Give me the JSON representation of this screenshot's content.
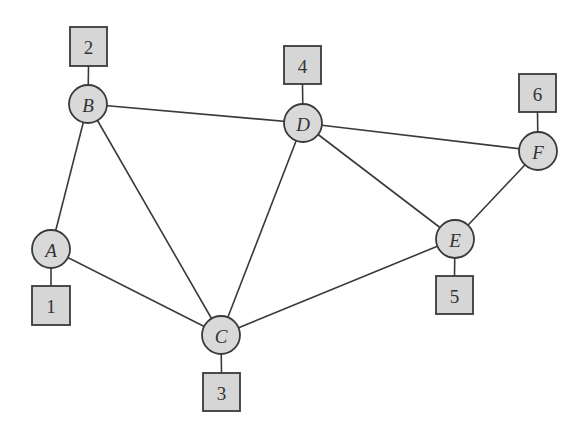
{
  "diagram": {
    "type": "graph",
    "colors": {
      "node_fill": "#d9d9d9",
      "box_fill": "#d6d6d6",
      "stroke": "#3a3a3a",
      "text": "#333333",
      "background": "#ffffff"
    },
    "nodes": [
      {
        "id": "A",
        "label": "A",
        "cx": 51,
        "cy": 249,
        "r": 19
      },
      {
        "id": "B",
        "label": "B",
        "cx": 88,
        "cy": 104,
        "r": 19
      },
      {
        "id": "C",
        "label": "C",
        "cx": 221,
        "cy": 335,
        "r": 19
      },
      {
        "id": "D",
        "label": "D",
        "cx": 303,
        "cy": 123,
        "r": 19
      },
      {
        "id": "E",
        "label": "E",
        "cx": 455,
        "cy": 239,
        "r": 19
      },
      {
        "id": "F",
        "label": "F",
        "cx": 538,
        "cy": 151,
        "r": 19
      }
    ],
    "boxes": [
      {
        "id": "1",
        "label": "1",
        "attached_to": "A",
        "x": 32,
        "y": 286,
        "w": 38,
        "h": 39
      },
      {
        "id": "2",
        "label": "2",
        "attached_to": "B",
        "x": 70,
        "y": 27,
        "w": 37,
        "h": 39
      },
      {
        "id": "3",
        "label": "3",
        "attached_to": "C",
        "x": 203,
        "y": 373,
        "w": 37,
        "h": 38
      },
      {
        "id": "4",
        "label": "4",
        "attached_to": "D",
        "x": 284,
        "y": 46,
        "w": 37,
        "h": 38
      },
      {
        "id": "5",
        "label": "5",
        "attached_to": "E",
        "x": 436,
        "y": 276,
        "w": 37,
        "h": 38
      },
      {
        "id": "6",
        "label": "6",
        "attached_to": "F",
        "x": 519,
        "y": 74,
        "w": 37,
        "h": 38
      }
    ],
    "edges": [
      [
        "A",
        "B"
      ],
      [
        "A",
        "C"
      ],
      [
        "B",
        "C"
      ],
      [
        "B",
        "D"
      ],
      [
        "C",
        "D"
      ],
      [
        "C",
        "E"
      ],
      [
        "D",
        "E"
      ],
      [
        "D",
        "F"
      ],
      [
        "E",
        "F"
      ]
    ],
    "labels": {
      "A": "A",
      "B": "B",
      "C": "C",
      "D": "D",
      "E": "E",
      "F": "F",
      "box1": "1",
      "box2": "2",
      "box3": "3",
      "box4": "4",
      "box5": "5",
      "box6": "6"
    }
  }
}
